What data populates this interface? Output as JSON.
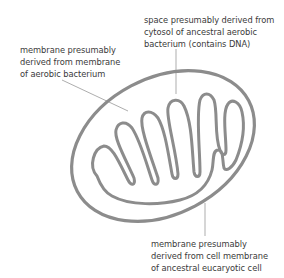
{
  "diagram": {
    "colors": {
      "membrane": "#8c8c8c",
      "leader_line": "#8a8a8a",
      "text": "#3a3a3a",
      "background": "#ffffff"
    },
    "labels": {
      "cytosol_space": {
        "lines": [
          "space presumably derived from",
          "cytosol of ancestral aerobic",
          "bacterium (contains DNA)"
        ]
      },
      "inner_membrane": {
        "lines": [
          "membrane presumably",
          "derived from membrane",
          "of aerobic bacterium"
        ]
      },
      "outer_membrane": {
        "lines": [
          "membrane presumably",
          "derived from cell membrane",
          "of ancestral eucaryotic cell"
        ]
      }
    }
  }
}
